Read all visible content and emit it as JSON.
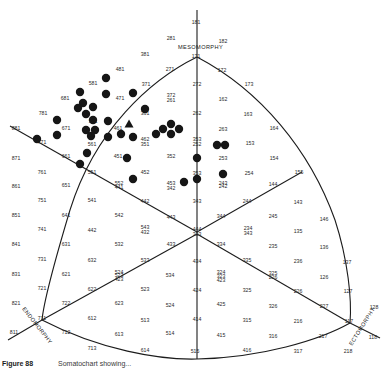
{
  "figure": {
    "caption_prefix": "Figure 88",
    "caption_text": "Somatochart showing..."
  },
  "axes": {
    "mesomorphy": "MESOMORPHY",
    "endomorphy": "ENDOMORPHY",
    "ectomorphy": "ECTOMORPHY"
  },
  "colors": {
    "ink": "#1c1c1c",
    "dot": "#161616",
    "background": "#ffffff"
  },
  "grid_labels": [
    {
      "t": "181",
      "x": 196,
      "y": 24
    },
    {
      "t": "281",
      "x": 171,
      "y": 40
    },
    {
      "t": "182",
      "x": 223,
      "y": 43
    },
    {
      "t": "381",
      "x": 145,
      "y": 56
    },
    {
      "t": "171",
      "x": 196,
      "y": 58
    },
    {
      "t": "481",
      "x": 120,
      "y": 71
    },
    {
      "t": "271",
      "x": 170,
      "y": 71
    },
    {
      "t": "172",
      "x": 222,
      "y": 72
    },
    {
      "t": "173",
      "x": 249,
      "y": 86
    },
    {
      "t": "581",
      "x": 93,
      "y": 85
    },
    {
      "t": "371",
      "x": 146,
      "y": 86
    },
    {
      "t": "272",
      "x": 197,
      "y": 86
    },
    {
      "t": "372",
      "x": 171,
      "y": 97
    },
    {
      "t": "261",
      "x": 171,
      "y": 102
    },
    {
      "t": "681",
      "x": 65,
      "y": 100
    },
    {
      "t": "471",
      "x": 120,
      "y": 100
    },
    {
      "t": "162",
      "x": 223,
      "y": 101
    },
    {
      "t": "781",
      "x": 43,
      "y": 115
    },
    {
      "t": "361",
      "x": 145,
      "y": 115
    },
    {
      "t": "262",
      "x": 197,
      "y": 115
    },
    {
      "t": "163",
      "x": 248,
      "y": 116
    },
    {
      "t": "571",
      "x": 93,
      "y": 123
    },
    {
      "t": "881",
      "x": 16,
      "y": 130
    },
    {
      "t": "671",
      "x": 66,
      "y": 130
    },
    {
      "t": "461",
      "x": 118,
      "y": 130
    },
    {
      "t": "263",
      "x": 223,
      "y": 131
    },
    {
      "t": "164",
      "x": 274,
      "y": 130
    },
    {
      "t": "462",
      "x": 145,
      "y": 141
    },
    {
      "t": "351",
      "x": 145,
      "y": 146
    },
    {
      "t": "353",
      "x": 197,
      "y": 141
    },
    {
      "t": "252",
      "x": 197,
      "y": 146
    },
    {
      "t": "153",
      "x": 250,
      "y": 145
    },
    {
      "t": "771",
      "x": 42,
      "y": 144
    },
    {
      "t": "561",
      "x": 92,
      "y": 146
    },
    {
      "t": "871",
      "x": 16,
      "y": 160
    },
    {
      "t": "661",
      "x": 66,
      "y": 158
    },
    {
      "t": "451",
      "x": 118,
      "y": 158
    },
    {
      "t": "352",
      "x": 171,
      "y": 158
    },
    {
      "t": "253",
      "x": 223,
      "y": 160
    },
    {
      "t": "154",
      "x": 274,
      "y": 160
    },
    {
      "t": "761",
      "x": 42,
      "y": 174
    },
    {
      "t": "551",
      "x": 92,
      "y": 174
    },
    {
      "t": "452",
      "x": 145,
      "y": 174
    },
    {
      "t": "353",
      "x": 197,
      "y": 175
    },
    {
      "t": "254",
      "x": 249,
      "y": 175
    },
    {
      "t": "155",
      "x": 299,
      "y": 174
    },
    {
      "t": "552",
      "x": 119,
      "y": 185
    },
    {
      "t": "441",
      "x": 119,
      "y": 189
    },
    {
      "t": "453",
      "x": 171,
      "y": 185
    },
    {
      "t": "342",
      "x": 171,
      "y": 190
    },
    {
      "t": "243",
      "x": 223,
      "y": 185
    },
    {
      "t": "242",
      "x": 223,
      "y": 188
    },
    {
      "t": "144",
      "x": 273,
      "y": 186
    },
    {
      "t": "861",
      "x": 16,
      "y": 188
    },
    {
      "t": "651",
      "x": 66,
      "y": 187
    },
    {
      "t": "751",
      "x": 42,
      "y": 202
    },
    {
      "t": "541",
      "x": 92,
      "y": 202
    },
    {
      "t": "442",
      "x": 145,
      "y": 203
    },
    {
      "t": "343",
      "x": 197,
      "y": 203
    },
    {
      "t": "244",
      "x": 247,
      "y": 203
    },
    {
      "t": "143",
      "x": 298,
      "y": 204
    },
    {
      "t": "851",
      "x": 16,
      "y": 217
    },
    {
      "t": "641",
      "x": 66,
      "y": 217
    },
    {
      "t": "542",
      "x": 119,
      "y": 217
    },
    {
      "t": "443",
      "x": 171,
      "y": 219
    },
    {
      "t": "344",
      "x": 221,
      "y": 218
    },
    {
      "t": "245",
      "x": 273,
      "y": 218
    },
    {
      "t": "146",
      "x": 324,
      "y": 221
    },
    {
      "t": "741",
      "x": 42,
      "y": 231
    },
    {
      "t": "442",
      "x": 92,
      "y": 232
    },
    {
      "t": "543",
      "x": 145,
      "y": 229
    },
    {
      "t": "432",
      "x": 145,
      "y": 234
    },
    {
      "t": "444",
      "x": 197,
      "y": 231
    },
    {
      "t": "333",
      "x": 197,
      "y": 236
    },
    {
      "t": "234",
      "x": 248,
      "y": 230
    },
    {
      "t": "343",
      "x": 248,
      "y": 235
    },
    {
      "t": "135",
      "x": 298,
      "y": 233
    },
    {
      "t": "841",
      "x": 16,
      "y": 246
    },
    {
      "t": "631",
      "x": 66,
      "y": 246
    },
    {
      "t": "532",
      "x": 119,
      "y": 246
    },
    {
      "t": "433",
      "x": 171,
      "y": 246
    },
    {
      "t": "334",
      "x": 221,
      "y": 246
    },
    {
      "t": "235",
      "x": 273,
      "y": 248
    },
    {
      "t": "136",
      "x": 324,
      "y": 249
    },
    {
      "t": "731",
      "x": 42,
      "y": 261
    },
    {
      "t": "632",
      "x": 92,
      "y": 262
    },
    {
      "t": "533",
      "x": 145,
      "y": 262
    },
    {
      "t": "434",
      "x": 197,
      "y": 263
    },
    {
      "t": "335",
      "x": 247,
      "y": 262
    },
    {
      "t": "236",
      "x": 298,
      "y": 263
    },
    {
      "t": "137",
      "x": 347,
      "y": 264
    },
    {
      "t": "831",
      "x": 16,
      "y": 276
    },
    {
      "t": "621",
      "x": 66,
      "y": 276
    },
    {
      "t": "524",
      "x": 119,
      "y": 274
    },
    {
      "t": "523",
      "x": 119,
      "y": 277
    },
    {
      "t": "423",
      "x": 119,
      "y": 281
    },
    {
      "t": "534",
      "x": 170,
      "y": 277
    },
    {
      "t": "324",
      "x": 221,
      "y": 274
    },
    {
      "t": "323",
      "x": 221,
      "y": 278
    },
    {
      "t": "423",
      "x": 221,
      "y": 282
    },
    {
      "t": "325",
      "x": 273,
      "y": 275
    },
    {
      "t": "226",
      "x": 273,
      "y": 279
    },
    {
      "t": "126",
      "x": 324,
      "y": 279
    },
    {
      "t": "721",
      "x": 42,
      "y": 290
    },
    {
      "t": "622",
      "x": 92,
      "y": 291
    },
    {
      "t": "523",
      "x": 145,
      "y": 291
    },
    {
      "t": "424",
      "x": 197,
      "y": 292
    },
    {
      "t": "325",
      "x": 247,
      "y": 292
    },
    {
      "t": "226",
      "x": 298,
      "y": 293
    },
    {
      "t": "127",
      "x": 348,
      "y": 293
    },
    {
      "t": "821",
      "x": 16,
      "y": 305
    },
    {
      "t": "722",
      "x": 66,
      "y": 305
    },
    {
      "t": "623",
      "x": 119,
      "y": 305
    },
    {
      "t": "524",
      "x": 170,
      "y": 307
    },
    {
      "t": "425",
      "x": 221,
      "y": 306
    },
    {
      "t": "326",
      "x": 273,
      "y": 308
    },
    {
      "t": "227",
      "x": 324,
      "y": 308
    },
    {
      "t": "128",
      "x": 374,
      "y": 309
    },
    {
      "t": "711",
      "x": 42,
      "y": 320
    },
    {
      "t": "612",
      "x": 92,
      "y": 320
    },
    {
      "t": "513",
      "x": 145,
      "y": 322
    },
    {
      "t": "414",
      "x": 197,
      "y": 321
    },
    {
      "t": "315",
      "x": 247,
      "y": 322
    },
    {
      "t": "216",
      "x": 298,
      "y": 323
    },
    {
      "t": "117",
      "x": 349,
      "y": 323
    },
    {
      "t": "811",
      "x": 14,
      "y": 334
    },
    {
      "t": "712",
      "x": 66,
      "y": 334
    },
    {
      "t": "613",
      "x": 119,
      "y": 336
    },
    {
      "t": "514",
      "x": 170,
      "y": 335
    },
    {
      "t": "415",
      "x": 221,
      "y": 337
    },
    {
      "t": "316",
      "x": 273,
      "y": 338
    },
    {
      "t": "217",
      "x": 323,
      "y": 338
    },
    {
      "t": "118",
      "x": 373,
      "y": 339
    },
    {
      "t": "713",
      "x": 92,
      "y": 350
    },
    {
      "t": "614",
      "x": 145,
      "y": 352
    },
    {
      "t": "515",
      "x": 195,
      "y": 353
    },
    {
      "t": "416",
      "x": 247,
      "y": 352
    },
    {
      "t": "317",
      "x": 298,
      "y": 353
    },
    {
      "t": "218",
      "x": 348,
      "y": 353
    }
  ],
  "dots": [
    {
      "x": 106,
      "y": 78,
      "shape": "circle"
    },
    {
      "x": 80,
      "y": 92,
      "shape": "circle"
    },
    {
      "x": 106,
      "y": 94,
      "shape": "circle"
    },
    {
      "x": 133,
      "y": 93,
      "shape": "circle"
    },
    {
      "x": 83,
      "y": 103,
      "shape": "circle"
    },
    {
      "x": 78,
      "y": 108,
      "shape": "circle"
    },
    {
      "x": 93,
      "y": 107,
      "shape": "circle"
    },
    {
      "x": 86,
      "y": 114,
      "shape": "circle"
    },
    {
      "x": 145,
      "y": 109,
      "shape": "circle"
    },
    {
      "x": 57,
      "y": 120,
      "shape": "circle"
    },
    {
      "x": 93,
      "y": 120,
      "shape": "circle"
    },
    {
      "x": 108,
      "y": 121,
      "shape": "circle"
    },
    {
      "x": 129,
      "y": 124,
      "shape": "triangle"
    },
    {
      "x": 57,
      "y": 135,
      "shape": "circle"
    },
    {
      "x": 86,
      "y": 130,
      "shape": "circle"
    },
    {
      "x": 95,
      "y": 130,
      "shape": "circle"
    },
    {
      "x": 91,
      "y": 136,
      "shape": "circle"
    },
    {
      "x": 108,
      "y": 137,
      "shape": "circle"
    },
    {
      "x": 121,
      "y": 134,
      "shape": "circle"
    },
    {
      "x": 133,
      "y": 137,
      "shape": "circle"
    },
    {
      "x": 37,
      "y": 139,
      "shape": "circle"
    },
    {
      "x": 156,
      "y": 134,
      "shape": "circle"
    },
    {
      "x": 163,
      "y": 129,
      "shape": "circle"
    },
    {
      "x": 171,
      "y": 124,
      "shape": "circle"
    },
    {
      "x": 179,
      "y": 129,
      "shape": "circle"
    },
    {
      "x": 171,
      "y": 134,
      "shape": "circle"
    },
    {
      "x": 87,
      "y": 153,
      "shape": "circle"
    },
    {
      "x": 80,
      "y": 164,
      "shape": "circle"
    },
    {
      "x": 127,
      "y": 158,
      "shape": "circle"
    },
    {
      "x": 197,
      "y": 158,
      "shape": "circle"
    },
    {
      "x": 217,
      "y": 145,
      "shape": "circle"
    },
    {
      "x": 225,
      "y": 145,
      "shape": "circle"
    },
    {
      "x": 223,
      "y": 174,
      "shape": "circle"
    },
    {
      "x": 133,
      "y": 179,
      "shape": "circle"
    },
    {
      "x": 184,
      "y": 182,
      "shape": "circle"
    },
    {
      "x": 197,
      "y": 179,
      "shape": "circle"
    }
  ]
}
